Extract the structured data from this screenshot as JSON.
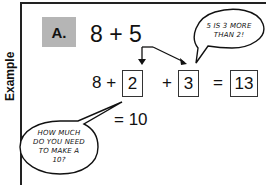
{
  "side_label": "Example",
  "problem": {
    "label": "A.",
    "expression": "8 + 5",
    "step": {
      "first_term": "8 +",
      "box1": "2",
      "plus": "+",
      "box2": "3",
      "equals": "=",
      "result": "13"
    },
    "sub_result": "= 10"
  },
  "bubbles": [
    {
      "lines": [
        "5 IS 3 MORE",
        "THAN 2!"
      ]
    },
    {
      "lines": [
        "HOW MUCH",
        "DO YOU NEED",
        "TO MAKE A",
        "10?"
      ]
    }
  ],
  "colors": {
    "badge_fill": "#b5b5b5",
    "ink": "#111111",
    "background": "#ffffff"
  }
}
